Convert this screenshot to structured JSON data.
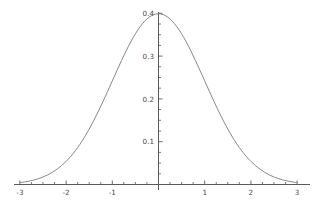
{
  "chart_data": {
    "type": "line",
    "title": "",
    "subtitle": "",
    "xlabel": "",
    "ylabel": "",
    "xlim": [
      -3,
      3
    ],
    "ylim": [
      0,
      0.4
    ],
    "grid": false,
    "legend": null,
    "x_ticks": [
      {
        "value": -3,
        "label": "-3"
      },
      {
        "value": -2,
        "label": "-2"
      },
      {
        "value": -1,
        "label": "-1"
      },
      {
        "value": 1,
        "label": "1"
      },
      {
        "value": 2,
        "label": "2"
      },
      {
        "value": 3,
        "label": "3"
      }
    ],
    "x_minor_ticks": [
      -2.75,
      -2.5,
      -2.25,
      -1.75,
      -1.5,
      -1.25,
      -0.75,
      -0.5,
      -0.25,
      0.25,
      0.5,
      0.75,
      1.25,
      1.5,
      1.75,
      2.25,
      2.5,
      2.75
    ],
    "y_ticks": [
      {
        "value": 0.1,
        "label": "0.1"
      },
      {
        "value": 0.2,
        "label": "0.2"
      },
      {
        "value": 0.3,
        "label": "0.3"
      },
      {
        "value": 0.4,
        "label": "0.4"
      }
    ],
    "y_minor_ticks": [
      0.025,
      0.05,
      0.075,
      0.125,
      0.15,
      0.175,
      0.225,
      0.25,
      0.275,
      0.325,
      0.35,
      0.375
    ],
    "series": [
      {
        "name": "standard normal pdf",
        "color": "#7a7a7a",
        "line_width": 0.9,
        "x": [
          -3,
          -2.9,
          -2.8,
          -2.7,
          -2.6,
          -2.5,
          -2.4,
          -2.3,
          -2.2,
          -2.1,
          -2,
          -1.9,
          -1.8,
          -1.7,
          -1.6,
          -1.5,
          -1.4,
          -1.3,
          -1.2,
          -1.1,
          -1,
          -0.9,
          -0.8,
          -0.7,
          -0.6,
          -0.5,
          -0.4,
          -0.3,
          -0.2,
          -0.1,
          0,
          0.1,
          0.2,
          0.3,
          0.4,
          0.5,
          0.6,
          0.7,
          0.8,
          0.9,
          1,
          1.1,
          1.2,
          1.3,
          1.4,
          1.5,
          1.6,
          1.7,
          1.8,
          1.9,
          2,
          2.1,
          2.2,
          2.3,
          2.4,
          2.5,
          2.6,
          2.7,
          2.8,
          2.9,
          3
        ],
        "y": [
          0.0044,
          0.006,
          0.0079,
          0.0104,
          0.0136,
          0.0175,
          0.0224,
          0.0283,
          0.0355,
          0.044,
          0.054,
          0.0656,
          0.079,
          0.094,
          0.1109,
          0.1295,
          0.1497,
          0.1714,
          0.1942,
          0.2179,
          0.242,
          0.2661,
          0.2897,
          0.3123,
          0.3332,
          0.3521,
          0.3683,
          0.3814,
          0.391,
          0.397,
          0.3989,
          0.397,
          0.391,
          0.3814,
          0.3683,
          0.3521,
          0.3332,
          0.3123,
          0.2897,
          0.2661,
          0.242,
          0.2179,
          0.1942,
          0.1714,
          0.1497,
          0.1295,
          0.1109,
          0.094,
          0.079,
          0.0656,
          0.054,
          0.044,
          0.0355,
          0.0283,
          0.0224,
          0.0175,
          0.0136,
          0.0104,
          0.0079,
          0.006,
          0.0044
        ]
      }
    ],
    "axis_color": "#5a5a5a",
    "text_color": "#4a4a4a",
    "background": "#ffffff",
    "peak": {
      "x": 0,
      "y": 0.3989
    }
  }
}
